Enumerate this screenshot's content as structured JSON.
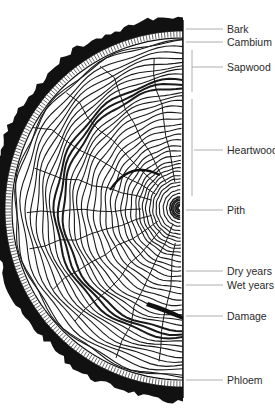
{
  "colors": {
    "ink": "#1a1a1a",
    "bark": "#111111",
    "leader": "#9a9a9a",
    "label": "#2a2a2a",
    "background": "#ffffff"
  },
  "labels": [
    {
      "id": "bark",
      "text": "Bark"
    },
    {
      "id": "cambium",
      "text": "Cambium"
    },
    {
      "id": "sapwood",
      "text": "Sapwood"
    },
    {
      "id": "heartwood",
      "text": "Heartwood"
    },
    {
      "id": "pith",
      "text": "Pith"
    },
    {
      "id": "dry-years",
      "text": "Dry years"
    },
    {
      "id": "wet-years",
      "text": "Wet years"
    },
    {
      "id": "damage",
      "text": "Damage"
    },
    {
      "id": "phloem",
      "text": "Phloem"
    }
  ]
}
